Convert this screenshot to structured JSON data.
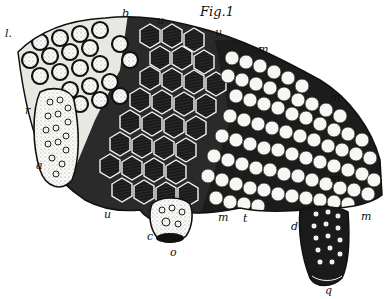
{
  "figure": {
    "title": "Fig.1",
    "colors": {
      "ink": "#111111",
      "paper": "#ffffff",
      "cap": "#f4f4f0"
    }
  },
  "labels": [
    {
      "id": "l",
      "text": "l.",
      "x": 5,
      "y": 28
    },
    {
      "id": "b",
      "text": "b",
      "x": 122,
      "y": 8
    },
    {
      "id": "u_top1",
      "text": "u",
      "x": 157,
      "y": 15
    },
    {
      "id": "u_top2",
      "text": "u",
      "x": 215,
      "y": 27
    },
    {
      "id": "m_top",
      "text": "m",
      "x": 258,
      "y": 44
    },
    {
      "id": "m_right1",
      "text": "m",
      "x": 330,
      "y": 92
    },
    {
      "id": "m_right2",
      "text": "m",
      "x": 330,
      "y": 173
    },
    {
      "id": "r",
      "text": "r",
      "x": 25,
      "y": 105
    },
    {
      "id": "a",
      "text": "a",
      "x": 36,
      "y": 160
    },
    {
      "id": "u_bottom",
      "text": "u",
      "x": 104,
      "y": 209
    },
    {
      "id": "c",
      "text": "c",
      "x": 147,
      "y": 231
    },
    {
      "id": "o",
      "text": "o",
      "x": 170,
      "y": 247
    },
    {
      "id": "m_bottom",
      "text": "m",
      "x": 218,
      "y": 212
    },
    {
      "id": "t",
      "text": "t",
      "x": 243,
      "y": 213
    },
    {
      "id": "d",
      "text": "d",
      "x": 291,
      "y": 221
    },
    {
      "id": "m_br",
      "text": "m",
      "x": 361,
      "y": 211
    },
    {
      "id": "q",
      "text": "q",
      "x": 325,
      "y": 285
    }
  ]
}
